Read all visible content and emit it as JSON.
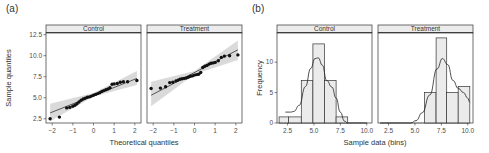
{
  "chart_data": [
    {
      "panel_label": "(a)",
      "type": "scatter",
      "subtype": "qq-plot",
      "xlabel": "Theoretical quantiles",
      "ylabel": "Sample quantiles",
      "xlim": [
        -2.3,
        2.3
      ],
      "ylim": [
        2.0,
        12.7
      ],
      "xticks": [
        "-2",
        "-1",
        "0",
        "1",
        "2"
      ],
      "yticks": [
        "2.5",
        "5.0",
        "7.5",
        "10.0",
        "12.5"
      ],
      "facets": [
        {
          "strip": "Control",
          "reference_line": {
            "x": [
              -2.1,
              2.1
            ],
            "y": [
              3.2,
              7.3
            ]
          },
          "band_upper": [
            [
              -2.1,
              4.3
            ],
            [
              0,
              5.55
            ],
            [
              2.1,
              8.2
            ]
          ],
          "band_lower": [
            [
              -2.1,
              2.2
            ],
            [
              0,
              5.15
            ],
            [
              2.1,
              6.5
            ]
          ],
          "points": [
            [
              -2.1,
              2.5
            ],
            [
              -1.65,
              2.7
            ],
            [
              -1.3,
              3.8
            ],
            [
              -1.15,
              3.85
            ],
            [
              -1.0,
              4.0
            ],
            [
              -0.9,
              4.1
            ],
            [
              -0.8,
              4.3
            ],
            [
              -0.7,
              4.5
            ],
            [
              -0.6,
              4.7
            ],
            [
              -0.5,
              4.85
            ],
            [
              -0.4,
              4.95
            ],
            [
              -0.3,
              5.05
            ],
            [
              -0.2,
              5.1
            ],
            [
              -0.1,
              5.2
            ],
            [
              0.0,
              5.3
            ],
            [
              0.1,
              5.4
            ],
            [
              0.2,
              5.5
            ],
            [
              0.3,
              5.6
            ],
            [
              0.4,
              5.75
            ],
            [
              0.5,
              5.85
            ],
            [
              0.6,
              5.95
            ],
            [
              0.7,
              6.05
            ],
            [
              0.8,
              6.2
            ],
            [
              0.9,
              6.6
            ],
            [
              1.0,
              6.65
            ],
            [
              1.15,
              6.7
            ],
            [
              1.3,
              6.85
            ],
            [
              1.45,
              6.9
            ],
            [
              1.65,
              6.9
            ],
            [
              2.1,
              7.05
            ]
          ]
        },
        {
          "strip": "Treatment",
          "reference_line": {
            "x": [
              -2.1,
              2.1
            ],
            "y": [
              5.3,
              10.7
            ]
          },
          "band_upper": [
            [
              -2.1,
              6.9
            ],
            [
              0,
              8.2
            ],
            [
              2.1,
              11.8
            ]
          ],
          "band_lower": [
            [
              -2.1,
              4.0
            ],
            [
              0,
              7.8
            ],
            [
              2.1,
              9.5
            ]
          ],
          "points": [
            [
              -2.1,
              6.1
            ],
            [
              -1.65,
              6.15
            ],
            [
              -1.4,
              6.3
            ],
            [
              -1.2,
              6.8
            ],
            [
              -1.05,
              6.85
            ],
            [
              -0.9,
              7.0
            ],
            [
              -0.8,
              7.1
            ],
            [
              -0.7,
              7.2
            ],
            [
              -0.6,
              7.25
            ],
            [
              -0.5,
              7.3
            ],
            [
              -0.4,
              7.35
            ],
            [
              -0.3,
              7.45
            ],
            [
              -0.2,
              7.55
            ],
            [
              -0.1,
              7.6
            ],
            [
              0.0,
              7.7
            ],
            [
              0.1,
              7.75
            ],
            [
              0.2,
              7.8
            ],
            [
              0.3,
              8.0
            ],
            [
              0.4,
              8.6
            ],
            [
              0.5,
              8.75
            ],
            [
              0.6,
              8.85
            ],
            [
              0.7,
              9.0
            ],
            [
              0.8,
              9.1
            ],
            [
              0.9,
              9.15
            ],
            [
              1.0,
              9.2
            ],
            [
              1.15,
              9.4
            ],
            [
              1.3,
              9.8
            ],
            [
              1.45,
              9.95
            ],
            [
              1.7,
              10.0
            ],
            [
              2.1,
              10.1
            ]
          ]
        }
      ]
    },
    {
      "panel_label": "(b)",
      "type": "bar",
      "subtype": "histogram-with-density",
      "xlabel": "Sample data (bins)",
      "ylabel": "Frequency",
      "xlim": [
        1.5,
        10.5
      ],
      "ylim": [
        0,
        14.8
      ],
      "xticks": [
        "2.5",
        "5.0",
        "7.5",
        "10.0"
      ],
      "yticks": [
        "0",
        "5",
        "10"
      ],
      "facets": [
        {
          "strip": "Control",
          "bins": [
            [
              1.7,
              2.6,
              1
            ],
            [
              2.6,
              3.8,
              1
            ],
            [
              3.8,
              4.9,
              7
            ],
            [
              4.9,
              6.0,
              13
            ],
            [
              6.0,
              7.1,
              7
            ],
            [
              7.1,
              8.2,
              1
            ]
          ],
          "density_curve": [
            [
              2.3,
              1.8
            ],
            [
              2.8,
              1.8
            ],
            [
              3.1,
              1.9
            ],
            [
              3.6,
              2.9
            ],
            [
              4.2,
              6.0
            ],
            [
              4.7,
              9.0
            ],
            [
              5.1,
              10.6
            ],
            [
              5.4,
              10.7
            ],
            [
              5.8,
              9.5
            ],
            [
              6.2,
              7.0
            ],
            [
              6.7,
              5.9
            ],
            [
              7.1,
              4.1
            ],
            [
              7.5,
              1.8
            ],
            [
              7.9,
              0.3
            ],
            [
              8.2,
              0.0
            ],
            [
              10.0,
              0.0
            ]
          ]
        },
        {
          "strip": "Treatment",
          "bins": [
            [
              5.9,
              7.0,
              5
            ],
            [
              7.0,
              8.0,
              14
            ],
            [
              8.0,
              9.1,
              5
            ],
            [
              9.1,
              10.2,
              6
            ]
          ],
          "density_curve": [
            [
              1.7,
              0.0
            ],
            [
              4.6,
              0.0
            ],
            [
              5.1,
              0.4
            ],
            [
              5.7,
              1.7
            ],
            [
              6.4,
              4.6
            ],
            [
              7.1,
              8.9
            ],
            [
              7.6,
              10.6
            ],
            [
              8.1,
              9.6
            ],
            [
              8.6,
              7.0
            ],
            [
              9.1,
              5.7
            ],
            [
              9.6,
              5.0
            ],
            [
              10.0,
              4.1
            ],
            [
              10.2,
              3.4
            ]
          ]
        }
      ]
    }
  ]
}
